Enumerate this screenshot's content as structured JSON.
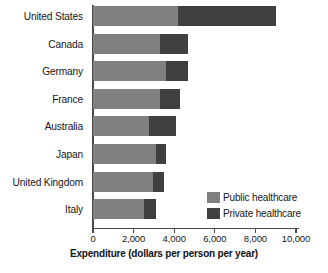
{
  "chart_data": {
    "type": "bar",
    "orientation": "horizontal",
    "stacked": true,
    "title": "",
    "xlabel": "Expenditure (dollars per person per year)",
    "ylabel": "",
    "xlim": [
      0,
      10000
    ],
    "xticks": [
      0,
      2000,
      4000,
      6000,
      8000,
      10000
    ],
    "xticklabels": [
      "0",
      "2,000",
      "4,000",
      "6,000",
      "8,000",
      "10,000"
    ],
    "grid": false,
    "legend_position": "lower-right-inside",
    "categories": [
      "United States",
      "Canada",
      "Germany",
      "France",
      "Australia",
      "Japan",
      "United Kingdom",
      "Italy"
    ],
    "series": [
      {
        "name": "Public healthcare",
        "color": "#808080",
        "values": [
          4200,
          3300,
          3600,
          3300,
          2750,
          3100,
          2950,
          2500
        ]
      },
      {
        "name": "Private healthcare",
        "color": "#404040",
        "values": [
          4800,
          1400,
          1100,
          1000,
          1350,
          500,
          550,
          600
        ]
      }
    ],
    "totals": [
      9000,
      4700,
      4700,
      4300,
      4100,
      3600,
      3500,
      3100
    ]
  },
  "legend": {
    "items": [
      {
        "label": "Public healthcare",
        "color": "#808080"
      },
      {
        "label": "Private healthcare",
        "color": "#404040"
      }
    ]
  },
  "axis": {
    "x_title": "Expenditure (dollars per person per year)"
  },
  "colors": {
    "public": "#808080",
    "private": "#404040",
    "axis": "#4a4a4a",
    "text": "#161616",
    "background": "#ffffff"
  }
}
